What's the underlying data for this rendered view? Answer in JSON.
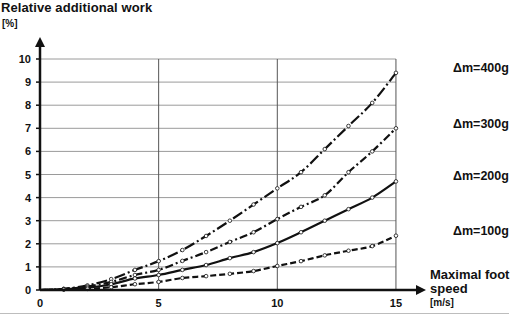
{
  "chart_data": {
    "type": "line",
    "title": "Relative additional work",
    "ylabel": "Relative additional work [%]",
    "y_unit": "[%]",
    "xlabel": "Maximal foot speed",
    "x_unit": "[m/s]",
    "xlim": [
      0,
      15
    ],
    "ylim": [
      0,
      10
    ],
    "x_ticks": [
      0,
      5,
      10,
      15
    ],
    "y_ticks": [
      0,
      1,
      2,
      3,
      4,
      5,
      6,
      7,
      8,
      9,
      10
    ],
    "grid": {
      "horizontal": true,
      "vertical": true,
      "vertical_at": [
        5,
        10,
        15
      ]
    },
    "legend_position": "right (inline labels at curve ends)",
    "x": [
      0,
      1,
      2,
      3,
      4,
      5,
      6,
      7,
      8,
      9,
      10,
      11,
      12,
      13,
      14,
      15
    ],
    "series": [
      {
        "name": "Δm=400g",
        "line_style": "dash-dot-long",
        "values": [
          0,
          0.05,
          0.2,
          0.47,
          0.87,
          1.25,
          1.73,
          2.34,
          3.0,
          3.7,
          4.4,
          5.1,
          6.1,
          7.1,
          8.1,
          9.4
        ]
      },
      {
        "name": "Δm=300g",
        "line_style": "dash-dot",
        "values": [
          0,
          0.04,
          0.15,
          0.35,
          0.65,
          0.87,
          1.26,
          1.64,
          2.08,
          2.5,
          3.07,
          3.6,
          4.1,
          5.1,
          6.0,
          7.0
        ]
      },
      {
        "name": "Δm=200g",
        "line_style": "solid",
        "values": [
          0,
          0.03,
          0.1,
          0.25,
          0.5,
          0.65,
          0.87,
          1.08,
          1.38,
          1.64,
          2.03,
          2.5,
          3.0,
          3.5,
          4.0,
          4.7
        ]
      },
      {
        "name": "Δm=100g",
        "line_style": "dashed",
        "values": [
          0,
          0.02,
          0.05,
          0.12,
          0.25,
          0.35,
          0.52,
          0.6,
          0.7,
          0.82,
          1.04,
          1.25,
          1.5,
          1.7,
          1.9,
          2.35
        ]
      }
    ]
  },
  "labels": {
    "title": "Relative additional work",
    "y_unit": "[%]",
    "x_title": "Maximal foot speed",
    "x_unit": "[m/s]",
    "series": [
      "Δm=400g",
      "Δm=300g",
      "Δm=200g",
      "Δm=100g"
    ]
  },
  "style": {
    "line_color": "#111111",
    "grid_color": "#9a9a9a",
    "marker_fill": "#ffffff"
  }
}
